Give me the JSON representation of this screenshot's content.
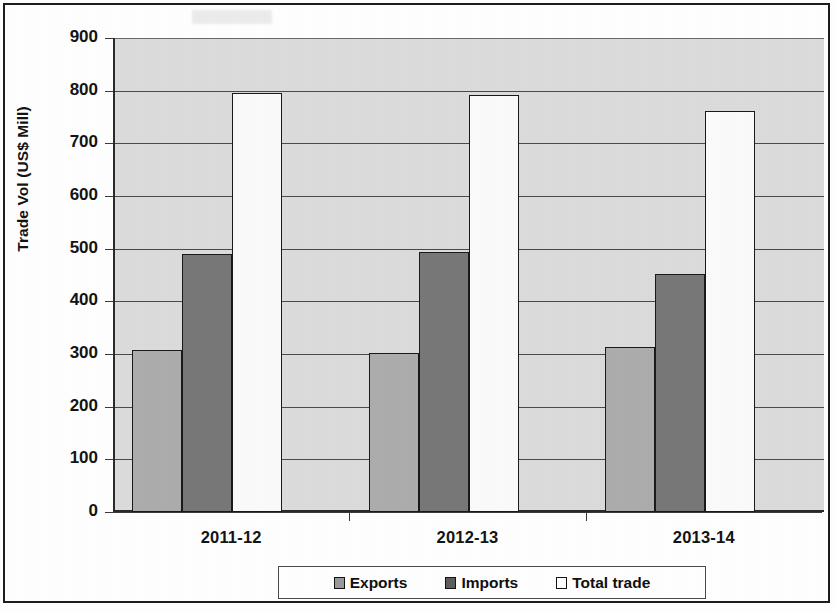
{
  "chart_data": {
    "type": "bar",
    "title": "",
    "xlabel": "",
    "ylabel": "Trade Vol (US$ Mill)",
    "categories": [
      "2011-12",
      "2012-13",
      "2013-14"
    ],
    "series": [
      {
        "name": "Exports",
        "values": [
          307,
          301,
          313
        ],
        "color": "#adadad"
      },
      {
        "name": "Imports",
        "values": [
          490,
          493,
          452
        ],
        "color": "#787878"
      },
      {
        "name": "Total trade",
        "values": [
          795,
          791,
          762
        ],
        "color": "#fbfbfb"
      }
    ],
    "ylim": [
      0,
      900
    ],
    "yticks": [
      0,
      100,
      200,
      300,
      400,
      500,
      600,
      700,
      800,
      900
    ],
    "ytick_labels": [
      "0",
      "100",
      "200",
      "300",
      "400",
      "500",
      "600",
      "700",
      "800",
      "900"
    ],
    "grid": true,
    "legend_position": "bottom",
    "plot_background": "#dcdcdc",
    "axis_color": "#2b2b2b"
  },
  "legend": {
    "items": [
      {
        "label": "Exports",
        "swatch": "exports-swatch"
      },
      {
        "label": "Imports",
        "swatch": "imports-swatch"
      },
      {
        "label": "Total trade",
        "swatch": "total-trade-swatch"
      }
    ]
  },
  "axis": {
    "y_title": "Trade Vol (US$ Mill)",
    "y_labels": [
      "900",
      "800",
      "700",
      "600",
      "500",
      "400",
      "300",
      "200",
      "100",
      "0"
    ],
    "x_labels": [
      "2011-12",
      "2012-13",
      "2013-14"
    ]
  }
}
